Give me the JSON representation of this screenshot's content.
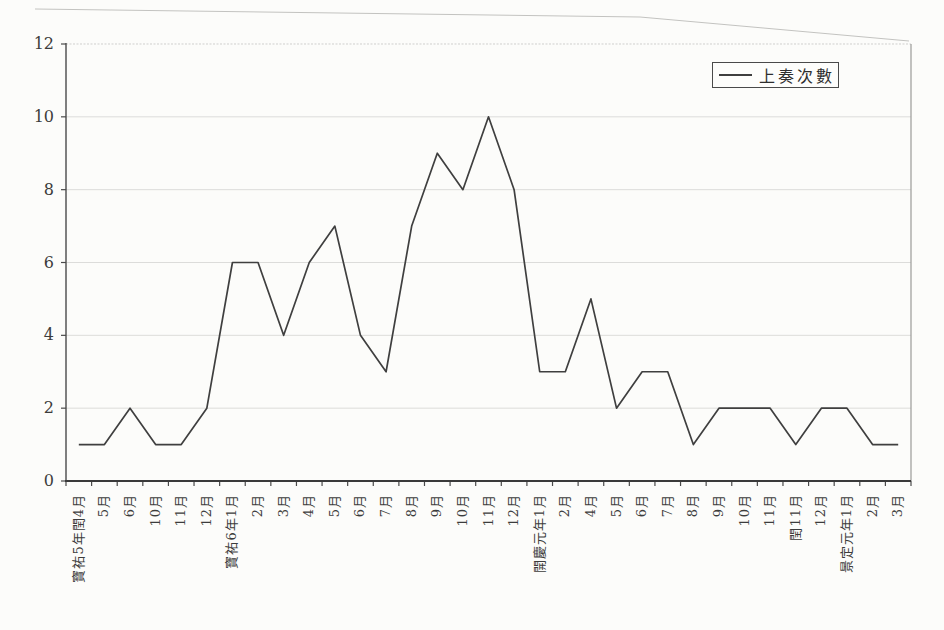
{
  "chart_data": {
    "type": "line",
    "title": "",
    "xlabel": "",
    "ylabel": "",
    "categories": [
      "寶祐5年閏4月",
      "5月",
      "6月",
      "10月",
      "11月",
      "12月",
      "寶祐6年1月",
      "2月",
      "3月",
      "4月",
      "5月",
      "6月",
      "7月",
      "8月",
      "9月",
      "10月",
      "11月",
      "12月",
      "開慶元年1月",
      "2月",
      "4月",
      "5月",
      "6月",
      "7月",
      "8月",
      "9月",
      "10月",
      "11月",
      "閏11月",
      "12月",
      "景定元年1月",
      "2月",
      "3月"
    ],
    "series": [
      {
        "name": "上奏次數",
        "values": [
          1,
          1,
          2,
          1,
          1,
          2,
          6,
          6,
          4,
          6,
          7,
          4,
          3,
          7,
          9,
          8,
          10,
          8,
          3,
          3,
          5,
          2,
          3,
          3,
          1,
          2,
          2,
          2,
          1,
          2,
          2,
          1,
          1
        ]
      }
    ],
    "ylim": [
      0,
      12
    ],
    "yticks": [
      0,
      2,
      4,
      6,
      8,
      10,
      12
    ],
    "grid": "horizontal-light",
    "legend_position": "top-right",
    "colors": {
      "line": "#3f3f3f",
      "grid": "#dcdcda",
      "axis": "#4a4a4a",
      "plot_border": "#9a9a98",
      "plot_top": "#cfcfcd",
      "scan_border": "#c3c3c0",
      "text": "#3c3c3c",
      "background": "#fcfcfa"
    }
  }
}
